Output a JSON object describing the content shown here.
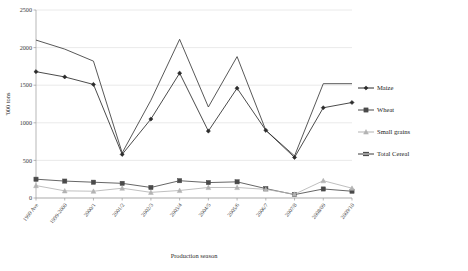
{
  "chart_data": {
    "type": "line",
    "title": "",
    "xlabel": "Production season",
    "ylabel": "'000 tons",
    "ylim": [
      0,
      2500
    ],
    "ytick_labels": [
      "0",
      "500",
      "1000",
      "1500",
      "2000",
      "2500"
    ],
    "ytick_values": [
      0,
      500,
      1000,
      1500,
      2000,
      2500
    ],
    "grid": true,
    "legend_position": "right",
    "categories": [
      "1999 Ave",
      "1999-2000",
      "2000/1",
      "2001/2",
      "2002/3",
      "2003/4",
      "2004/5",
      "2005/6",
      "2006/7",
      "2007/8",
      "2008/09",
      "2009/10"
    ],
    "series": [
      {
        "name": "Maize",
        "color": "#2b2b2b",
        "marker": "diamond",
        "values": [
          1680,
          1610,
          1510,
          580,
          1050,
          1660,
          890,
          1460,
          900,
          540,
          1200,
          1270
        ]
      },
      {
        "name": "Wheat",
        "color": "#4a4a4a",
        "marker": "square",
        "values": [
          250,
          225,
          210,
          195,
          140,
          230,
          205,
          215,
          125,
          45,
          120,
          90
        ]
      },
      {
        "name": "Small grains",
        "color": "#b3b3b3",
        "marker": "triangle",
        "values": [
          165,
          95,
          90,
          130,
          75,
          100,
          140,
          140,
          115,
          50,
          230,
          130
        ]
      },
      {
        "name": "Total Cereal",
        "color": "#3a3a3a",
        "marker": "none",
        "values": [
          2100,
          1980,
          1820,
          600,
          1300,
          2110,
          1210,
          1880,
          900,
          560,
          1520,
          1520
        ]
      }
    ]
  },
  "legend": {
    "entries": [
      {
        "label": "Maize"
      },
      {
        "label": "Wheat"
      },
      {
        "label": "Small grains"
      },
      {
        "label": "Total Cereal"
      }
    ]
  }
}
